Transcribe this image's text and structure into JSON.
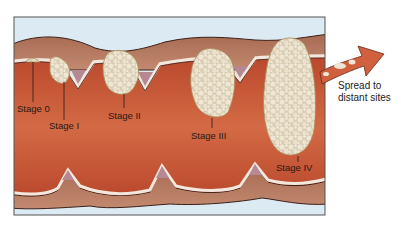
{
  "diagram": {
    "stages": [
      {
        "id": "stage-0",
        "label": "Stage 0"
      },
      {
        "id": "stage-1",
        "label": "Stage I"
      },
      {
        "id": "stage-2",
        "label": "Stage II"
      },
      {
        "id": "stage-3",
        "label": "Stage III"
      },
      {
        "id": "stage-4",
        "label": "Stage IV"
      }
    ],
    "spread_label_line1": "Spread to",
    "spread_label_line2": "distant sites",
    "colors": {
      "background_sky": "#dceaf3",
      "muscle": "#c65a3a",
      "muscle_dark": "#a8432a",
      "serosa": "#b47a5e",
      "mucosa_light": "#f3e6dc",
      "tumor": "#e2d6bf",
      "tumor_outline": "#a88a58",
      "frame": "#555555",
      "arrow": "#d0603e"
    }
  }
}
